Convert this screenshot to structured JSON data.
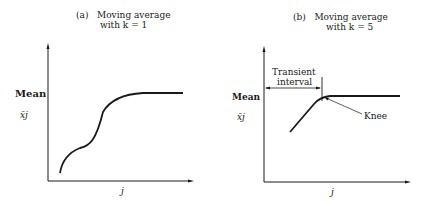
{
  "panels": [
    {
      "id": "a",
      "label": "(a)",
      "title_line1": "Moving average",
      "title_line2": "with k = 1",
      "ylabel": "Mean",
      "ysymbol": "x̄j",
      "xlabel": "j"
    },
    {
      "id": "b",
      "label": "(b)",
      "title_line1": "Moving average",
      "title_line2": "with k = 5",
      "ylabel": "Mean",
      "ysymbol": "x̄j",
      "xlabel": "j",
      "annotation_transient_line1": "Transient",
      "annotation_transient_line2": "interval",
      "annotation_knee": "Knee"
    }
  ],
  "colors": {
    "line": "#1a1a1a",
    "background": "#ffffff"
  }
}
